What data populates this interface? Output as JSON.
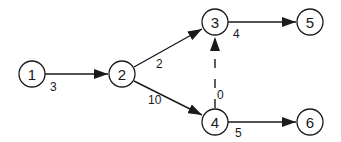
{
  "diagram": {
    "type": "directed-network",
    "nodes": [
      {
        "id": "1",
        "label": "1",
        "x": 32,
        "y": 74
      },
      {
        "id": "2",
        "label": "2",
        "x": 122,
        "y": 74
      },
      {
        "id": "3",
        "label": "3",
        "x": 215,
        "y": 22
      },
      {
        "id": "4",
        "label": "4",
        "x": 215,
        "y": 122
      },
      {
        "id": "5",
        "label": "5",
        "x": 310,
        "y": 22
      },
      {
        "id": "6",
        "label": "6",
        "x": 310,
        "y": 122
      }
    ],
    "edges": [
      {
        "from": "1",
        "to": "2",
        "weight": "3",
        "style": "solid"
      },
      {
        "from": "2",
        "to": "3",
        "weight": "2",
        "style": "solid"
      },
      {
        "from": "2",
        "to": "4",
        "weight": "10",
        "style": "solid"
      },
      {
        "from": "3",
        "to": "5",
        "weight": "4",
        "style": "solid"
      },
      {
        "from": "4",
        "to": "3",
        "weight": "0",
        "style": "dashed"
      },
      {
        "from": "4",
        "to": "6",
        "weight": "5",
        "style": "solid"
      }
    ],
    "colors": {
      "stroke": "#1a1a1a",
      "background": "#ffffff"
    }
  }
}
